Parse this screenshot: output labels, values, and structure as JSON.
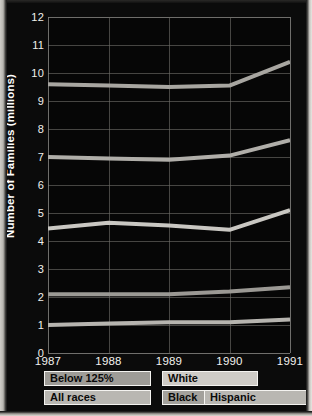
{
  "chart_data": {
    "type": "line",
    "title": "",
    "xlabel": "",
    "ylabel": "Number of Families (millions)",
    "x": [
      "1987",
      "1988",
      "1989",
      "1990",
      "1991"
    ],
    "categories": [
      "1987",
      "1988",
      "1989",
      "1990",
      "1991"
    ],
    "ylim": [
      0,
      12
    ],
    "ytick_step": 1,
    "yticks": [
      "0",
      "1",
      "2",
      "3",
      "4",
      "5",
      "6",
      "7",
      "8",
      "9",
      "10",
      "11",
      "12"
    ],
    "grid": true,
    "legend_position": "below",
    "series": [
      {
        "name": "All races",
        "values": [
          9.6,
          9.55,
          9.5,
          9.55,
          10.4
        ],
        "color": "#a8a6a1"
      },
      {
        "name": "White",
        "values": [
          7.0,
          6.95,
          6.9,
          7.05,
          7.6
        ],
        "color": "#b0aea9"
      },
      {
        "name": "Below 125%",
        "values": [
          4.45,
          4.65,
          4.55,
          4.4,
          5.1
        ],
        "color": "#c9c7c2"
      },
      {
        "name": "Black",
        "values": [
          2.1,
          2.1,
          2.1,
          2.2,
          2.35
        ],
        "color": "#9b9994"
      },
      {
        "name": "Hispanic",
        "values": [
          1.0,
          1.05,
          1.1,
          1.1,
          1.2
        ],
        "color": "#b6b4af"
      }
    ]
  },
  "legend": {
    "row1": [
      {
        "label": "Below 125%",
        "swatch": "#9e9c97",
        "left": 30,
        "width": 107
      },
      {
        "label": "White",
        "swatch": "#cecbc6",
        "left": 148,
        "width": 96
      }
    ],
    "row2": [
      {
        "label": "All races",
        "swatch": "#b9b7b2",
        "left": 30,
        "width": 107
      },
      {
        "label": "Black",
        "swatch": "#a3a19c",
        "left": 148,
        "width": 96
      },
      {
        "label": "Hispanic",
        "swatch": "#b9b7b2",
        "left": 190,
        "width": 110
      }
    ]
  },
  "axis": {
    "y_title": "Number of Families (millions)"
  }
}
